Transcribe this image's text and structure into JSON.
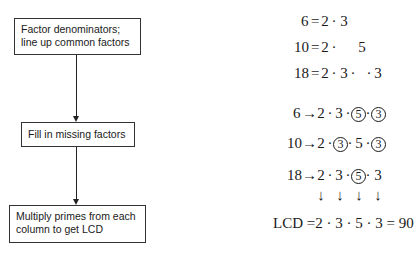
{
  "flowchart": {
    "steps": [
      {
        "line1": "Factor denominators;",
        "line2": "line up common factors"
      },
      {
        "line1": "Fill in missing factors"
      },
      {
        "line1": "Multiply primes from each",
        "line2": "column to get LCD"
      }
    ]
  },
  "factorization": {
    "rows": [
      {
        "num": "6",
        "eq": "=",
        "cols": [
          "2",
          "3",
          "",
          ""
        ]
      },
      {
        "num": "10",
        "eq": "=",
        "cols": [
          "2",
          "",
          "5",
          ""
        ]
      },
      {
        "num": "18",
        "eq": "=",
        "cols": [
          "2",
          "3",
          "",
          "3"
        ]
      }
    ]
  },
  "filled": {
    "rows": [
      {
        "num": "6",
        "arrow": "→",
        "cols": [
          "2",
          "3",
          "5",
          "3"
        ],
        "circled": [
          false,
          false,
          true,
          true
        ]
      },
      {
        "num": "10",
        "arrow": "→",
        "cols": [
          "2",
          "3",
          "5",
          "3"
        ],
        "circled": [
          false,
          true,
          false,
          true
        ]
      },
      {
        "num": "18",
        "arrow": "→",
        "cols": [
          "2",
          "3",
          "5",
          "3"
        ],
        "circled": [
          false,
          false,
          true,
          false
        ]
      }
    ],
    "down_arrows": [
      "↓",
      "↓",
      "↓",
      "↓"
    ]
  },
  "result": {
    "label": "LCD",
    "eq": "=",
    "expr": "2 · 3 · 5 · 3",
    "eq2": "=",
    "value": "90"
  },
  "symbols": {
    "dot": "·"
  }
}
